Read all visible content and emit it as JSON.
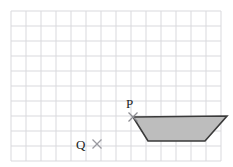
{
  "figure": {
    "canvas": {
      "width": 233,
      "height": 167,
      "background": "#ffffff"
    },
    "grid": {
      "name": "square-grid",
      "origin_x": 11,
      "origin_y": 11,
      "cell_size": 15,
      "columns": 14,
      "rows": 10,
      "line_color": "#d9d9dd",
      "line_width": 1,
      "right_edge": 221,
      "bottom_edge": 161
    },
    "shape": {
      "name": "trapezoid",
      "type": "polygon",
      "fill_color": "#bdbdbd",
      "stroke_color": "#3a3a3a",
      "stroke_width": 1.6,
      "vertices": [
        {
          "label": "P",
          "x": 133,
          "y": 117
        },
        {
          "x": 227,
          "y": 116
        },
        {
          "x": 205,
          "y": 141
        },
        {
          "x": 148,
          "y": 141
        }
      ]
    },
    "points": [
      {
        "id": "p",
        "label": "P",
        "marker": "cross-marker",
        "marker_x": 133,
        "marker_y": 117,
        "marker_size": 9,
        "marker_color": "#8d8d93",
        "label_x": 126,
        "label_y": 97
      },
      {
        "id": "q",
        "label": "Q",
        "marker": "cross-marker",
        "marker_x": 97,
        "marker_y": 144,
        "marker_size": 9,
        "marker_color": "#9a9aa0",
        "label_x": 76,
        "label_y": 138
      }
    ]
  }
}
